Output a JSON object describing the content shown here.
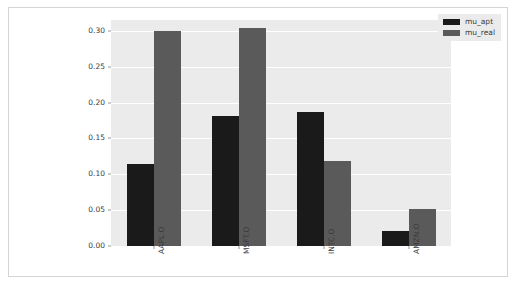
{
  "chart_data": {
    "type": "bar",
    "title": "",
    "subtitle": "",
    "xlabel": "",
    "ylabel": "",
    "categories": [
      "AAPL.O",
      "MSFT.O",
      "INTC.O",
      "AMZN.O"
    ],
    "series": [
      {
        "name": "mu_apt",
        "color": "#1a1a1a",
        "values": [
          0.115,
          0.181,
          0.187,
          0.021
        ]
      },
      {
        "name": "mu_real",
        "color": "#5a5a5a",
        "values": [
          0.3,
          0.304,
          0.119,
          0.052
        ]
      }
    ],
    "ylim": [
      0.0,
      0.315
    ],
    "yticks": [
      0.0,
      0.05,
      0.1,
      0.15,
      0.2,
      0.25,
      0.3
    ],
    "ytick_labels": [
      "0.00",
      "0.05",
      "0.10",
      "0.15",
      "0.20",
      "0.25",
      "0.30"
    ],
    "grid": true,
    "grid_axis": "y",
    "grid_color": "#ffffff",
    "plot_background": "#ebebeb",
    "figure_background": "#ffffff",
    "legend_position": "upper right",
    "xtick_rotation": 90
  },
  "legend": {
    "entries": [
      {
        "label": "mu_apt",
        "swatch_class": "series-apt"
      },
      {
        "label": "mu_real",
        "swatch_class": "series-real"
      }
    ]
  }
}
